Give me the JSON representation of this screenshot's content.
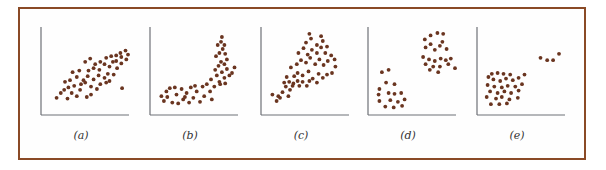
{
  "figure": {
    "frame_color": "#8a4a26",
    "dot_color": "#6a3520",
    "axis_color": "#6d7076"
  },
  "chart_data": [
    {
      "type": "scatter",
      "label": "(a)",
      "title": "",
      "xlabel": "",
      "ylabel": "",
      "description": "Positive linear association with one outlier",
      "grid": false,
      "xlim": [
        0,
        10
      ],
      "ylim": [
        0,
        10
      ],
      "points": [
        [
          1.5,
          1.4
        ],
        [
          2.0,
          2.0
        ],
        [
          2.4,
          2.4
        ],
        [
          2.8,
          1.3
        ],
        [
          3.3,
          2.0
        ],
        [
          3.9,
          1.6
        ],
        [
          4.3,
          2.4
        ],
        [
          5.1,
          1.5
        ],
        [
          5.6,
          1.8
        ],
        [
          2.9,
          2.7
        ],
        [
          3.6,
          2.9
        ],
        [
          4.4,
          3.1
        ],
        [
          4.9,
          3.3
        ],
        [
          5.6,
          2.8
        ],
        [
          6.3,
          2.5
        ],
        [
          6.7,
          3.1
        ],
        [
          7.4,
          3.3
        ],
        [
          7.8,
          3.5
        ],
        [
          3.9,
          4.0
        ],
        [
          4.7,
          3.6
        ],
        [
          5.2,
          4.1
        ],
        [
          5.9,
          3.7
        ],
        [
          6.5,
          4.2
        ],
        [
          7.2,
          3.9
        ],
        [
          7.6,
          4.4
        ],
        [
          8.3,
          4.3
        ],
        [
          8.7,
          5.1
        ],
        [
          5.3,
          4.8
        ],
        [
          5.9,
          5.1
        ],
        [
          6.6,
          4.9
        ],
        [
          7.2,
          5.6
        ],
        [
          7.8,
          5.3
        ],
        [
          8.2,
          5.9
        ],
        [
          8.6,
          6.0
        ],
        [
          9.2,
          5.7
        ],
        [
          6.7,
          5.9
        ],
        [
          7.4,
          6.4
        ],
        [
          8.0,
          6.6
        ],
        [
          8.6,
          6.7
        ],
        [
          9.1,
          7.0
        ],
        [
          9.7,
          7.3
        ],
        [
          10.0,
          6.8
        ],
        [
          9.2,
          6.5
        ],
        [
          9.8,
          6.2
        ],
        [
          4.9,
          5.9
        ],
        [
          5.5,
          6.3
        ],
        [
          6.1,
          5.6
        ],
        [
          3.4,
          4.6
        ],
        [
          4.2,
          4.8
        ],
        [
          2.5,
          3.4
        ],
        [
          3.1,
          3.6
        ],
        [
          9.3,
          2.6
        ]
      ]
    },
    {
      "type": "scatter",
      "label": "(b)",
      "title": "",
      "xlabel": "",
      "ylabel": "",
      "description": "Curved (nonlinear) association: flat then rising steeply",
      "grid": false,
      "xlim": [
        0,
        10
      ],
      "ylim": [
        0,
        10
      ],
      "points": [
        [
          1.0,
          1.6
        ],
        [
          1.3,
          1.0
        ],
        [
          1.6,
          2.2
        ],
        [
          2.0,
          2.6
        ],
        [
          2.3,
          0.8
        ],
        [
          2.8,
          1.8
        ],
        [
          3.0,
          0.7
        ],
        [
          3.4,
          2.5
        ],
        [
          3.6,
          1.2
        ],
        [
          4.0,
          2.0
        ],
        [
          4.3,
          0.8
        ],
        [
          4.5,
          2.7
        ],
        [
          4.8,
          1.4
        ],
        [
          5.2,
          2.2
        ],
        [
          5.6,
          0.9
        ],
        [
          5.9,
          2.8
        ],
        [
          6.1,
          1.6
        ],
        [
          6.4,
          3.1
        ],
        [
          6.8,
          2.2
        ],
        [
          7.0,
          1.2
        ],
        [
          3.8,
          1.5
        ],
        [
          2.6,
          2.7
        ],
        [
          5.0,
          2.9
        ],
        [
          1.7,
          1.5
        ],
        [
          6.9,
          3.7
        ],
        [
          7.3,
          2.8
        ],
        [
          7.6,
          4.2
        ],
        [
          7.9,
          3.4
        ],
        [
          8.2,
          4.6
        ],
        [
          8.5,
          3.9
        ],
        [
          8.8,
          5.0
        ],
        [
          9.1,
          4.2
        ],
        [
          9.4,
          4.5
        ],
        [
          7.4,
          4.9
        ],
        [
          7.8,
          5.4
        ],
        [
          8.1,
          5.9
        ],
        [
          8.5,
          5.6
        ],
        [
          8.8,
          6.2
        ],
        [
          7.5,
          6.6
        ],
        [
          7.9,
          7.0
        ],
        [
          8.3,
          7.5
        ],
        [
          8.6,
          6.9
        ],
        [
          7.7,
          8.0
        ],
        [
          8.1,
          8.4
        ],
        [
          8.5,
          8.0
        ],
        [
          8.2,
          9.0
        ],
        [
          8.0,
          3.1
        ],
        [
          8.6,
          3.2
        ],
        [
          9.7,
          5.2
        ]
      ]
    },
    {
      "type": "scatter",
      "label": "(c)",
      "title": "",
      "xlabel": "",
      "ylabel": "",
      "description": "Positive association with increasing spread (fan shape)",
      "grid": false,
      "xlim": [
        0,
        10
      ],
      "ylim": [
        0,
        10
      ],
      "points": [
        [
          1.0,
          1.8
        ],
        [
          1.5,
          1.0
        ],
        [
          1.7,
          1.6
        ],
        [
          1.9,
          1.4
        ],
        [
          2.2,
          2.1
        ],
        [
          2.6,
          2.8
        ],
        [
          2.9,
          1.6
        ],
        [
          3.1,
          2.4
        ],
        [
          3.4,
          2.9
        ],
        [
          2.4,
          3.3
        ],
        [
          2.7,
          4.0
        ],
        [
          3.0,
          3.4
        ],
        [
          3.5,
          3.2
        ],
        [
          4.0,
          3.5
        ],
        [
          4.2,
          2.9
        ],
        [
          4.6,
          3.4
        ],
        [
          5.1,
          2.9
        ],
        [
          5.4,
          3.5
        ],
        [
          3.6,
          4.1
        ],
        [
          4.0,
          4.5
        ],
        [
          4.6,
          4.2
        ],
        [
          5.3,
          4.7
        ],
        [
          5.8,
          3.8
        ],
        [
          6.3,
          3.3
        ],
        [
          6.5,
          4.4
        ],
        [
          7.0,
          3.9
        ],
        [
          7.5,
          4.3
        ],
        [
          3.2,
          5.2
        ],
        [
          3.9,
          5.6
        ],
        [
          4.4,
          6.1
        ],
        [
          5.0,
          5.8
        ],
        [
          5.5,
          6.4
        ],
        [
          6.1,
          5.6
        ],
        [
          6.6,
          6.2
        ],
        [
          7.1,
          5.5
        ],
        [
          7.6,
          6.0
        ],
        [
          4.1,
          7.0
        ],
        [
          4.7,
          7.6
        ],
        [
          5.2,
          6.8
        ],
        [
          5.7,
          7.4
        ],
        [
          6.3,
          7.0
        ],
        [
          6.8,
          7.7
        ],
        [
          7.3,
          7.0
        ],
        [
          8.0,
          6.7
        ],
        [
          8.4,
          6.2
        ],
        [
          5.0,
          8.3
        ],
        [
          5.6,
          8.8
        ],
        [
          6.3,
          8.0
        ],
        [
          7.0,
          8.5
        ],
        [
          7.5,
          7.8
        ],
        [
          5.4,
          9.4
        ],
        [
          6.8,
          9.1
        ],
        [
          8.1,
          4.5
        ],
        [
          8.5,
          5.3
        ]
      ]
    },
    {
      "type": "scatter",
      "label": "(d)",
      "title": "",
      "xlabel": "",
      "ylabel": "",
      "description": "Two distinct clusters: low-left and high-right",
      "grid": false,
      "xlim": [
        0,
        10
      ],
      "ylim": [
        0,
        10
      ],
      "points": [
        [
          1.3,
          4.6
        ],
        [
          2.1,
          4.9
        ],
        [
          1.8,
          3.3
        ],
        [
          2.8,
          3.1
        ],
        [
          1.0,
          2.5
        ],
        [
          0.9,
          1.8
        ],
        [
          2.1,
          2.0
        ],
        [
          2.8,
          1.9
        ],
        [
          3.6,
          2.0
        ],
        [
          1.0,
          1.0
        ],
        [
          2.3,
          1.1
        ],
        [
          3.2,
          0.9
        ],
        [
          4.0,
          1.2
        ],
        [
          1.7,
          0.3
        ],
        [
          2.7,
          0.2
        ],
        [
          3.7,
          0.4
        ],
        [
          6.4,
          8.7
        ],
        [
          7.1,
          9.2
        ],
        [
          7.9,
          9.5
        ],
        [
          8.6,
          9.4
        ],
        [
          6.5,
          7.7
        ],
        [
          7.1,
          8.1
        ],
        [
          7.6,
          7.4
        ],
        [
          8.2,
          7.9
        ],
        [
          8.5,
          8.4
        ],
        [
          9.0,
          7.5
        ],
        [
          6.2,
          6.5
        ],
        [
          6.9,
          6.2
        ],
        [
          7.6,
          6.0
        ],
        [
          8.3,
          6.3
        ],
        [
          8.9,
          6.1
        ],
        [
          9.5,
          6.3
        ],
        [
          6.5,
          5.6
        ],
        [
          7.4,
          5.3
        ],
        [
          8.2,
          5.3
        ],
        [
          9.2,
          5.6
        ],
        [
          10.0,
          5.1
        ],
        [
          7.0,
          4.9
        ],
        [
          8.0,
          4.6
        ]
      ]
    },
    {
      "type": "scatter",
      "label": "(e)",
      "title": "",
      "xlabel": "",
      "ylabel": "",
      "description": "Main positive cluster plus a small group of outliers at upper right",
      "grid": false,
      "xlim": [
        0,
        10
      ],
      "ylim": [
        0,
        10
      ],
      "points": [
        [
          1.0,
          4.0
        ],
        [
          1.4,
          4.4
        ],
        [
          2.1,
          4.5
        ],
        [
          2.8,
          4.4
        ],
        [
          3.6,
          4.3
        ],
        [
          1.6,
          3.7
        ],
        [
          2.4,
          3.5
        ],
        [
          3.1,
          3.8
        ],
        [
          3.9,
          3.6
        ],
        [
          4.6,
          3.9
        ],
        [
          0.9,
          3.0
        ],
        [
          1.7,
          2.8
        ],
        [
          2.6,
          2.7
        ],
        [
          3.3,
          2.9
        ],
        [
          4.2,
          2.8
        ],
        [
          5.0,
          3.1
        ],
        [
          1.2,
          2.2
        ],
        [
          2.1,
          2.0
        ],
        [
          2.9,
          2.2
        ],
        [
          3.7,
          2.0
        ],
        [
          4.6,
          2.3
        ],
        [
          0.8,
          1.5
        ],
        [
          1.9,
          1.3
        ],
        [
          2.6,
          1.5
        ],
        [
          3.5,
          1.2
        ],
        [
          4.5,
          1.4
        ],
        [
          1.3,
          0.6
        ],
        [
          2.3,
          0.6
        ],
        [
          3.2,
          0.7
        ],
        [
          5.3,
          4.3
        ],
        [
          7.2,
          6.4
        ],
        [
          8.0,
          6.1
        ],
        [
          8.7,
          6.1
        ],
        [
          9.4,
          6.9
        ]
      ]
    }
  ]
}
